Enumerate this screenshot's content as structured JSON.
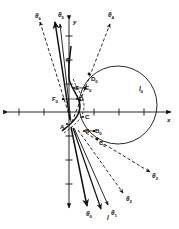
{
  "figure": {
    "type": "geometric-vector-diagram",
    "background_color": "#ffffff",
    "ink_color": "#111111",
    "axes": {
      "x_label": "x",
      "y_label": "y",
      "origin_px": [
        69,
        112
      ],
      "x_axis": {
        "from_px": [
          6,
          112
        ],
        "to_px": [
          172,
          112
        ],
        "arrow_both_ends": true
      },
      "y_axis": {
        "from_px": [
          69,
          18
        ],
        "to_px": [
          69,
          210
        ],
        "arrow_both_ends": true
      },
      "x_ticks_px": [
        19,
        44,
        94,
        119,
        144
      ],
      "y_ticks_px": [
        36,
        60,
        84,
        136,
        160,
        184
      ]
    },
    "circle": {
      "label": "l",
      "label_sub": "0",
      "center_px": [
        118,
        105
      ],
      "radius_px": 39
    },
    "rays": [
      {
        "name": "theta-0",
        "label": "θ",
        "sub": "0",
        "style": "solid",
        "label_px": [
          86,
          211
        ]
      },
      {
        "name": "theta-1",
        "label": "θ",
        "sub": "1",
        "style": "solid",
        "label_px": [
          111,
          210
        ]
      },
      {
        "name": "theta-2",
        "label": "θ",
        "sub": "2",
        "style": "dashed",
        "label_px": [
          126,
          196
        ]
      },
      {
        "name": "theta-3",
        "label": "θ",
        "sub": "3",
        "style": "dashed",
        "label_px": [
          152,
          173
        ]
      },
      {
        "name": "theta-4",
        "label": "θ",
        "sub": "4",
        "style": "dashed",
        "label_px": [
          108,
          12
        ]
      },
      {
        "name": "theta-5",
        "label": "θ",
        "sub": "5",
        "style": "solid",
        "label_px": [
          58,
          12
        ]
      },
      {
        "name": "theta-6",
        "label": "θ",
        "sub": "6",
        "style": "dashed",
        "label_px": [
          35,
          13
        ]
      }
    ],
    "line_label": {
      "name": "line-l",
      "label": "l",
      "label_px": [
        107,
        215
      ]
    },
    "points": [
      {
        "name": "point-A",
        "label": "A",
        "sub": "",
        "label_px": [
          60,
          128
        ],
        "marker_px": [
          67,
          124
        ]
      },
      {
        "name": "point-B",
        "label": "B",
        "sub": "",
        "label_px": [
          85,
          133
        ],
        "marker_px": [
          84,
          131
        ]
      },
      {
        "name": "point-B0",
        "label": "B",
        "sub": "0",
        "label_px": [
          95,
          132
        ],
        "marker_px": [
          94,
          131
        ]
      },
      {
        "name": "point-C",
        "label": "C",
        "sub": "",
        "label_px": [
          85,
          119
        ],
        "marker_px": [
          83,
          117
        ]
      },
      {
        "name": "point-C0",
        "label": "C",
        "sub": "0",
        "label_px": [
          99,
          143
        ],
        "marker_px": [
          97,
          139
        ]
      },
      {
        "name": "point-D",
        "label": "D",
        "sub": "",
        "label_px": [
          79,
          100
        ],
        "marker_px": [
          77,
          99
        ]
      },
      {
        "name": "point-D0",
        "label": "D",
        "sub": "0",
        "label_px": [
          91,
          79
        ],
        "marker_px": [
          89,
          74
        ]
      },
      {
        "name": "point-E",
        "label": "E",
        "sub": "",
        "label_px": [
          75,
          89
        ],
        "marker_px": [
          74,
          88
        ]
      },
      {
        "name": "point-E0",
        "label": "E",
        "sub": "0",
        "label_px": [
          86,
          89
        ],
        "marker_px": [
          85,
          88
        ]
      },
      {
        "name": "point-F",
        "label": "F",
        "sub": "",
        "label_px": [
          66,
          61
        ],
        "marker_px": [
          69,
          62
        ]
      },
      {
        "name": "point-F0",
        "label": "F",
        "sub": "0",
        "label_px": [
          53,
          99
        ],
        "marker_px": [
          63,
          99
        ]
      }
    ]
  }
}
